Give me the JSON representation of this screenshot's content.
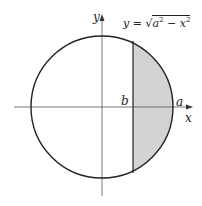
{
  "diagram": {
    "type": "circle-region",
    "labels": {
      "y_axis": "y",
      "x_axis": "x",
      "b": "b",
      "a": "a"
    },
    "equation": {
      "lhs": "y",
      "eq": "=",
      "radical_symbol": "√",
      "a_var": "a",
      "a_exp": "2",
      "minus": "−",
      "x_var": "x",
      "x_exp": "2"
    },
    "colors": {
      "stroke": "#222222",
      "shade": "#d3d3d3",
      "axis": "#555555"
    }
  }
}
